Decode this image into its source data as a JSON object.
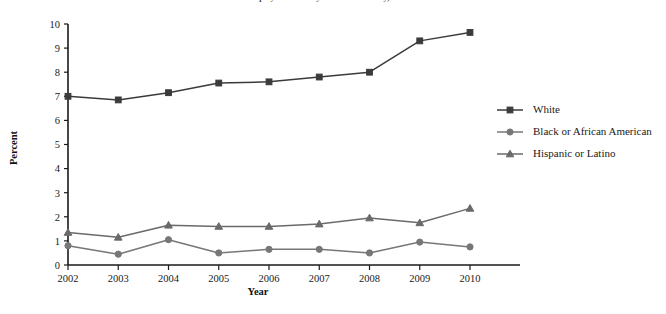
{
  "chart_data": {
    "type": "line",
    "title": "Unemployment rate by race and ethnicity, 2002-2010",
    "xlabel": "Year",
    "ylabel": "Percent",
    "categories": [
      "2002",
      "2003",
      "2004",
      "2005",
      "2006",
      "2007",
      "2008",
      "2009",
      "2010"
    ],
    "x": [
      2002,
      2003,
      2004,
      2005,
      2006,
      2007,
      2008,
      2009,
      2010
    ],
    "ylim": [
      0,
      10
    ],
    "xlim": [
      2002,
      2010
    ],
    "y_ticks": [
      "0",
      "1",
      "2",
      "3",
      "4",
      "5",
      "6",
      "7",
      "8",
      "9",
      "10"
    ],
    "grid": false,
    "legend_position": "right",
    "series": [
      {
        "name": "White",
        "marker": "square",
        "color": "#3b3b3b",
        "values": [
          7.0,
          6.85,
          7.15,
          7.55,
          7.6,
          7.8,
          8.0,
          9.3,
          9.65
        ]
      },
      {
        "name": "Black or African American",
        "marker": "circle",
        "color": "#777777",
        "values": [
          0.8,
          0.45,
          1.05,
          0.5,
          0.65,
          0.65,
          0.5,
          0.95,
          0.75
        ]
      },
      {
        "name": "Hispanic or Latino",
        "marker": "triangle",
        "color": "#6a6a6a",
        "values": [
          1.35,
          1.15,
          1.65,
          1.6,
          1.6,
          1.7,
          1.95,
          1.75,
          2.35
        ]
      }
    ]
  },
  "colors": {
    "axis": "#1a1a1a",
    "white_series": "#3b3b3b",
    "black_series": "#777777",
    "hispanic_series": "#6a6a6a",
    "background": "#ffffff"
  }
}
